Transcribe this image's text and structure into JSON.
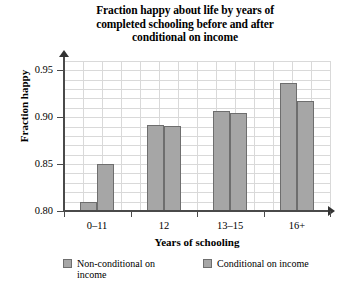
{
  "chart_data": {
    "type": "bar",
    "title": "Fraction happy about life by years of completed schooling before and after conditional on income",
    "title_lines": [
      "Fraction happy about life by years of",
      "completed schooling before and after",
      "conditional on income"
    ],
    "xlabel": "Years of schooling",
    "ylabel": "Fraction happy",
    "categories": [
      "0–11",
      "12",
      "13–15",
      "16+"
    ],
    "series": [
      {
        "name": "Non-conditional on income",
        "values": [
          0.81,
          0.892,
          0.907,
          0.937
        ]
      },
      {
        "name": "Conditional on income",
        "values": [
          0.85,
          0.891,
          0.905,
          0.917
        ]
      }
    ],
    "ylim": [
      0.8,
      0.96
    ],
    "yticks": [
      "0.95",
      "0.90",
      "0.85",
      "0.80"
    ],
    "ytick_values": [
      0.95,
      0.9,
      0.85,
      0.8
    ],
    "grid": true,
    "legend_position": "bottom",
    "bar_color": "#a6a6a6",
    "bar_border_color": "#6e6e6e",
    "grid_color": "#d9d9d9",
    "axis_color": "#4a4a4a"
  },
  "legend": {
    "items": [
      {
        "label_line1": "Non-conditional on",
        "label_line2": "income"
      },
      {
        "label_line1": "Conditional on income",
        "label_line2": ""
      }
    ]
  }
}
